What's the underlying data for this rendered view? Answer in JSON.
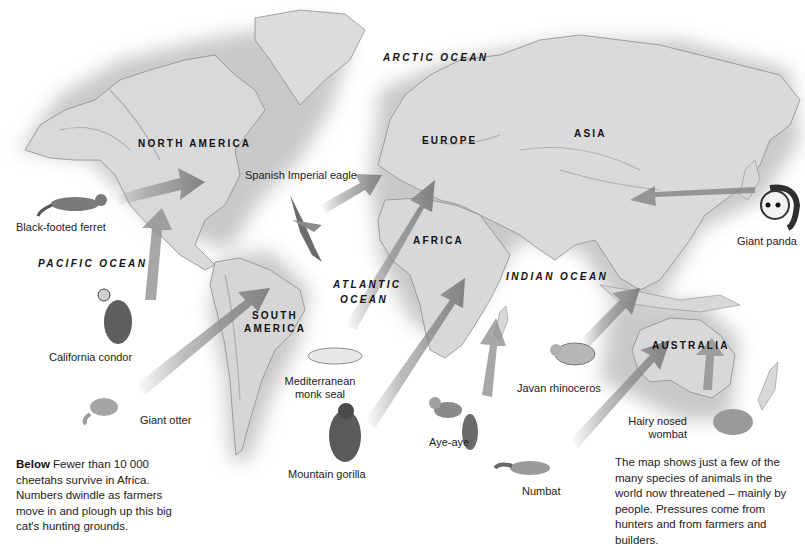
{
  "map": {
    "title": "Threatened animals of the world",
    "style": "grayscale relief world map with arrows from animal illustrations to habitats",
    "colors": {
      "land": "#d8d8d8",
      "land_shadow": "#a9a9a9",
      "ocean": "#ffffff",
      "arrow": "#8a8a8a",
      "text": "#1c1c1c"
    }
  },
  "regions": {
    "north_america": "NORTH AMERICA",
    "south_america": "SOUTH AMERICA",
    "europe": "EUROPE",
    "asia": "ASIA",
    "africa": "AFRICA",
    "australia": "AUSTRALIA"
  },
  "oceans": {
    "arctic": "ARCTIC OCEAN",
    "pacific": "PACIFIC OCEAN",
    "atlantic_line1": "ATLANTIC",
    "atlantic_line2": "OCEAN",
    "indian": "INDIAN OCEAN"
  },
  "animals": [
    {
      "id": "black-footed-ferret",
      "label": "Black-footed ferret"
    },
    {
      "id": "california-condor",
      "label": "California condor"
    },
    {
      "id": "giant-otter",
      "label": "Giant otter"
    },
    {
      "id": "spanish-imperial-eagle",
      "label": "Spanish Imperial eagle"
    },
    {
      "id": "mediterranean-monk-seal",
      "label_line1": "Mediterranean",
      "label_line2": "monk seal"
    },
    {
      "id": "mountain-gorilla",
      "label": "Mountain gorilla"
    },
    {
      "id": "aye-aye",
      "label": "Aye-aye"
    },
    {
      "id": "numbat",
      "label": "Numbat"
    },
    {
      "id": "javan-rhinoceros",
      "label": "Javan rhinoceros"
    },
    {
      "id": "hairy-nosed-wombat",
      "label_line1": "Hairy nosed",
      "label_line2": "wombat"
    },
    {
      "id": "giant-panda",
      "label": "Giant panda"
    }
  ],
  "captions": {
    "left_bold": "Below",
    "left_text": " Fewer than 10 000 cheetahs survive in Africa. Numbers dwindle as farmers move in and plough up this big cat's hunting grounds.",
    "right_text": "The map shows just a few of the many species of animals in the world now threatened – mainly by people. Pressures come from hunters and from farmers and builders."
  }
}
